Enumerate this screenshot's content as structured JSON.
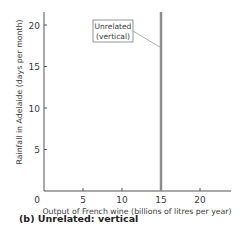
{
  "chart_data": {
    "type": "line",
    "title": "(b) Unrelated: vertical",
    "xlabel": "Output of French wine (billions of litres per year)",
    "ylabel": "Rainfall in Adelaide (days per month)",
    "xlim": [
      0,
      24
    ],
    "ylim": [
      0,
      22
    ],
    "x_ticks": [
      0,
      5,
      10,
      15,
      20
    ],
    "y_ticks": [
      5,
      10,
      15,
      20
    ],
    "x_tick_labels": [
      "0",
      "5",
      "10",
      "15",
      "20"
    ],
    "y_tick_labels": [
      "5",
      "10",
      "15",
      "20"
    ],
    "grid": false,
    "legend": null,
    "series": [
      {
        "name": "Unrelated (vertical)",
        "x": [
          15,
          15
        ],
        "y": [
          0,
          22
        ],
        "color": "#8c8c8c"
      }
    ],
    "annotations": [
      {
        "text_line1": "Unrelated",
        "text_line2": "(vertical)",
        "points_to": [
          15,
          17.5
        ]
      }
    ]
  },
  "caption": "(b) Unrelated: vertical"
}
